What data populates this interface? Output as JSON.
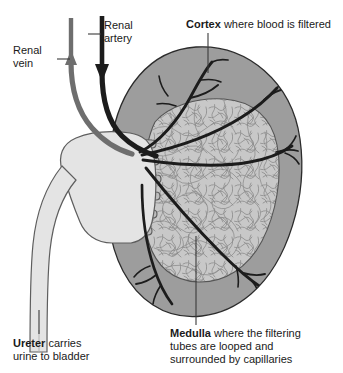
{
  "figure": {
    "background_color": "#ffffff"
  },
  "colors": {
    "cortex_fill": "#9d9d9d",
    "medulla_fill": "#c9c9c9",
    "pelvis_fill": "#e4e4e4",
    "ureter_fill": "#e4e4e4",
    "artery_stroke": "#1c1c1c",
    "vein_stroke": "#6e6e6e",
    "outline_stroke": "#2b2b2b",
    "capillary_stroke": "#8a8a8a",
    "text_color": "#1a1a1a",
    "leader_line": "#3a3a3a"
  },
  "labels": {
    "cortex": {
      "bold": "Cortex",
      "rest": " where blood is filtered"
    },
    "renal_artery": {
      "line1": "Renal",
      "line2": "artery"
    },
    "renal_vein": {
      "line1": "Renal",
      "line2": "vein"
    },
    "ureter": {
      "bold": "Ureter",
      "rest": " carries",
      "line2": "urine to bladder"
    },
    "medulla": {
      "bold": "Medulla",
      "rest": " where the filtering",
      "line2": "tubes are looped and",
      "line3": "surrounded by capillaries"
    }
  },
  "structures": [
    {
      "name": "cortex",
      "description": "outer kidney region, medium gray oval"
    },
    {
      "name": "medulla",
      "description": "inner kidney region, light gray with capillary texture"
    },
    {
      "name": "renal-pelvis",
      "description": "pale funnel with calyces at the hilum"
    },
    {
      "name": "ureter",
      "description": "pale tube descending from the renal pelvis"
    },
    {
      "name": "renal-artery",
      "description": "dark vessel entering the kidney, arrow pointing down"
    },
    {
      "name": "renal-vein",
      "description": "gray vessel leaving the kidney, arrow pointing up"
    },
    {
      "name": "arterial-branches",
      "description": "dark branching arteries spreading through cortex"
    }
  ],
  "flow": {
    "artery_direction": "down (into kidney)",
    "vein_direction": "up (out of kidney)"
  },
  "calyces_count": 6
}
